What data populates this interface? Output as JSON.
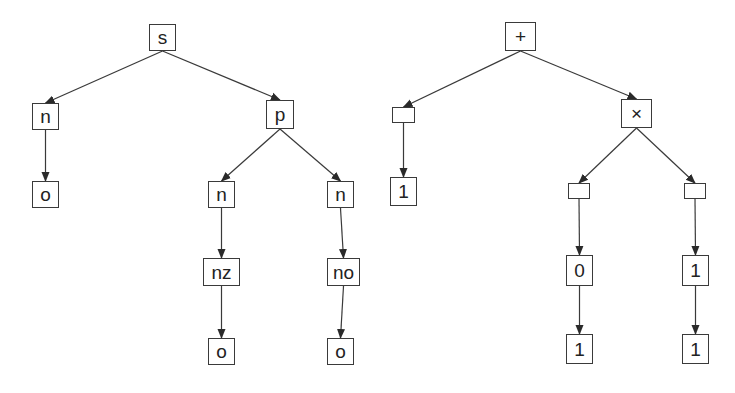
{
  "diagram": {
    "colors": {
      "stroke": "#3a3a3a",
      "text": "#222222",
      "background": "#ffffff"
    },
    "trees": [
      {
        "name": "grammar-parse-tree",
        "nodes": [
          {
            "id": "s",
            "label": "s",
            "x": 149,
            "y": 24,
            "w": 27,
            "h": 27
          },
          {
            "id": "n1",
            "label": "n",
            "x": 32,
            "y": 103,
            "w": 27,
            "h": 27
          },
          {
            "id": "p",
            "label": "p",
            "x": 266,
            "y": 100,
            "w": 28,
            "h": 29
          },
          {
            "id": "o1",
            "label": "o",
            "x": 32,
            "y": 181,
            "w": 27,
            "h": 27
          },
          {
            "id": "n2",
            "label": "n",
            "x": 208,
            "y": 181,
            "w": 27,
            "h": 27
          },
          {
            "id": "n3",
            "label": "n",
            "x": 327,
            "y": 181,
            "w": 27,
            "h": 27
          },
          {
            "id": "nz",
            "label": "nz",
            "x": 203,
            "y": 258,
            "w": 37,
            "h": 28
          },
          {
            "id": "no",
            "label": "no",
            "x": 327,
            "y": 258,
            "w": 33,
            "h": 28
          },
          {
            "id": "o2",
            "label": "o",
            "x": 208,
            "y": 338,
            "w": 27,
            "h": 27
          },
          {
            "id": "o3",
            "label": "o",
            "x": 327,
            "y": 338,
            "w": 27,
            "h": 27
          }
        ],
        "edges": [
          [
            "s",
            "n1"
          ],
          [
            "s",
            "p"
          ],
          [
            "n1",
            "o1"
          ],
          [
            "p",
            "n2"
          ],
          [
            "p",
            "n3"
          ],
          [
            "n2",
            "nz"
          ],
          [
            "n3",
            "no"
          ],
          [
            "nz",
            "o2"
          ],
          [
            "no",
            "o3"
          ]
        ]
      },
      {
        "name": "expression-tree",
        "nodes": [
          {
            "id": "plus",
            "label": "+",
            "x": 505,
            "y": 22,
            "w": 31,
            "h": 29
          },
          {
            "id": "e1",
            "label": "",
            "x": 392,
            "y": 107,
            "w": 23,
            "h": 16
          },
          {
            "id": "times",
            "label": "×",
            "x": 621,
            "y": 99,
            "w": 31,
            "h": 29
          },
          {
            "id": "one1",
            "label": "1",
            "x": 390,
            "y": 177,
            "w": 27,
            "h": 29
          },
          {
            "id": "e2",
            "label": "",
            "x": 568,
            "y": 183,
            "w": 22,
            "h": 16
          },
          {
            "id": "e3",
            "label": "",
            "x": 684,
            "y": 183,
            "w": 22,
            "h": 16
          },
          {
            "id": "zero",
            "label": "0",
            "x": 566,
            "y": 255,
            "w": 27,
            "h": 31
          },
          {
            "id": "one2",
            "label": "1",
            "x": 682,
            "y": 255,
            "w": 27,
            "h": 31
          },
          {
            "id": "one3",
            "label": "1",
            "x": 566,
            "y": 334,
            "w": 27,
            "h": 30
          },
          {
            "id": "one4",
            "label": "1",
            "x": 682,
            "y": 334,
            "w": 27,
            "h": 30
          }
        ],
        "edges": [
          [
            "plus",
            "e1"
          ],
          [
            "plus",
            "times"
          ],
          [
            "e1",
            "one1"
          ],
          [
            "times",
            "e2"
          ],
          [
            "times",
            "e3"
          ],
          [
            "e2",
            "zero"
          ],
          [
            "e3",
            "one2"
          ],
          [
            "zero",
            "one3"
          ],
          [
            "one2",
            "one4"
          ]
        ]
      }
    ]
  }
}
